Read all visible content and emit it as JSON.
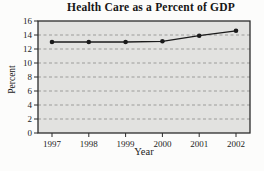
{
  "chart_data": {
    "type": "line",
    "title": "Health Care as a Percent of GDP",
    "xlabel": "Year",
    "ylabel": "Percent",
    "categories": [
      "1997",
      "1998",
      "1999",
      "2000",
      "2001",
      "2002"
    ],
    "values": [
      13.0,
      13.0,
      13.0,
      13.1,
      13.9,
      14.6
    ],
    "ylim": [
      0,
      16
    ],
    "ytick_step": 2,
    "grid": "horizontal-dashed",
    "legend": "none",
    "marker": "filled-circle",
    "colors": {
      "line": "#1b1b1b",
      "marker": "#1b1b1b",
      "plot_bg": "#e2e2e0",
      "grid": "#9c9c9a",
      "border": "#2b2b2b",
      "text": "#1c1c1c",
      "page_bg": "#fcfcfb"
    }
  }
}
